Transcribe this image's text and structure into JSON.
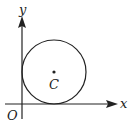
{
  "diagram": {
    "labels": {
      "y_axis": "y",
      "x_axis": "x",
      "origin": "O",
      "center": "C"
    },
    "circle": {
      "cx": 54,
      "cy": 72,
      "r": 32,
      "tangent_to": [
        "x-axis",
        "y-axis"
      ]
    },
    "colors": {
      "stroke": "#222222"
    }
  }
}
